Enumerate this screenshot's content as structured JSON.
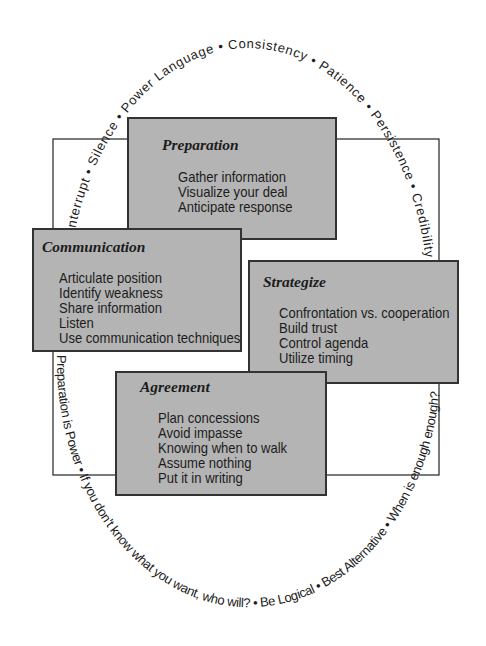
{
  "colors": {
    "box_fill": "#b4b4b4",
    "box_border": "#333333",
    "text": "#1c1c1c",
    "frame": "#333333"
  },
  "ring": {
    "separator": "•",
    "top": [
      "Interrupt",
      "Silence",
      "Power Language",
      "Consistency",
      "Patience",
      "Persistence",
      "Credibility"
    ],
    "bottom": [
      "Preparation is Power",
      "If you don’t know what you want, who will?",
      "Be Logical",
      "Best Alternative",
      "When is enough enough?"
    ]
  },
  "boxes": {
    "preparation": {
      "title": "Preparation",
      "items": [
        "Gather information",
        "Visualize your deal",
        "Anticipate response"
      ]
    },
    "communication": {
      "title": "Communication",
      "items": [
        "Articulate position",
        "Identify weakness",
        "Share information",
        "Listen",
        "Use communication techniques"
      ]
    },
    "strategize": {
      "title": "Strategize",
      "items": [
        "Confrontation vs. cooperation",
        "Build trust",
        "Control agenda",
        "Utilize timing"
      ]
    },
    "agreement": {
      "title": "Agreement",
      "items": [
        "Plan concessions",
        "Avoid impasse",
        "Knowing when to walk",
        "Assume nothing",
        "Put it in writing"
      ]
    }
  }
}
